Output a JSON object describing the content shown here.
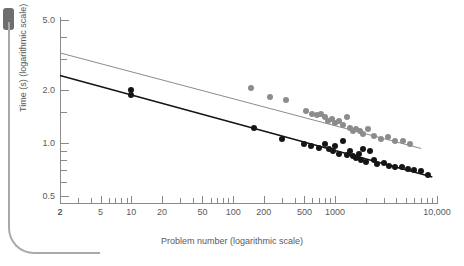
{
  "decor": {
    "tab_name": "bookmark-tab",
    "frame_name": "page-rule"
  },
  "chart_data": {
    "type": "scatter",
    "title": "",
    "xlabel": "Problem number (logarithmic scale)",
    "ylabel": "Time (s) (logarithmic scale)",
    "xscale": "log",
    "yscale": "log",
    "xlim": [
      2,
      10000
    ],
    "ylim": [
      0.45,
      5.2
    ],
    "grid": false,
    "legend": "none",
    "xticks_labeled": [
      {
        "value": 2,
        "label": "2"
      },
      {
        "value": 2,
        "label": "2"
      },
      {
        "value": 5,
        "label": "5"
      },
      {
        "value": 10,
        "label": "10"
      },
      {
        "value": 20,
        "label": "20"
      },
      {
        "value": 50,
        "label": "50"
      },
      {
        "value": 100,
        "label": "100"
      },
      {
        "value": 200,
        "label": "200"
      },
      {
        "value": 500,
        "label": "500"
      },
      {
        "value": 1000,
        "label": "1000"
      },
      {
        "value": 10000,
        "label": "10,000"
      }
    ],
    "yticks_labeled": [
      {
        "value": 5.0,
        "label": "5.0"
      },
      {
        "value": 2.0,
        "label": "2.0"
      },
      {
        "value": 1.0,
        "label": "1.0"
      },
      {
        "value": 0.5,
        "label": "0.5"
      }
    ],
    "yticks_minor": [
      4.0,
      3.0,
      1.5,
      0.9,
      0.8,
      0.7,
      0.6
    ],
    "xticks_minor": [
      3,
      4,
      6,
      7,
      8,
      9,
      30,
      40,
      60,
      70,
      80,
      90,
      300,
      400,
      600,
      700,
      800,
      900,
      2000,
      3000,
      4000,
      5000,
      6000,
      7000,
      8000,
      9000
    ],
    "series": [
      {
        "name": "upper-series",
        "color": "#8c8c8c",
        "marker": "circle",
        "points": [
          [
            150,
            2.05
          ],
          [
            230,
            1.82
          ],
          [
            330,
            1.76
          ],
          [
            520,
            1.52
          ],
          [
            600,
            1.47
          ],
          [
            660,
            1.44
          ],
          [
            720,
            1.47
          ],
          [
            800,
            1.4
          ],
          [
            860,
            1.34
          ],
          [
            930,
            1.37
          ],
          [
            1000,
            1.3
          ],
          [
            1100,
            1.34
          ],
          [
            1200,
            1.26
          ],
          [
            1300,
            1.41
          ],
          [
            1400,
            1.22
          ],
          [
            1500,
            1.17
          ],
          [
            1600,
            1.2
          ],
          [
            1750,
            1.17
          ],
          [
            1900,
            1.13
          ],
          [
            2100,
            1.2
          ],
          [
            2400,
            1.1
          ],
          [
            2800,
            1.06
          ],
          [
            3300,
            1.08
          ],
          [
            3900,
            1.02
          ],
          [
            4600,
            1.03
          ],
          [
            5400,
            0.99
          ]
        ],
        "fit_line": {
          "x1": 2,
          "y1": 3.25,
          "x2": 7000,
          "y2": 0.93
        }
      },
      {
        "name": "lower-series",
        "color": "#151515",
        "marker": "circle",
        "points": [
          [
            10,
            2.0
          ],
          [
            10,
            1.87
          ],
          [
            160,
            1.21
          ],
          [
            300,
            1.06
          ],
          [
            500,
            0.99
          ],
          [
            580,
            0.96
          ],
          [
            700,
            0.94
          ],
          [
            800,
            0.99
          ],
          [
            870,
            0.93
          ],
          [
            950,
            0.9
          ],
          [
            1000,
            0.96
          ],
          [
            1100,
            0.87
          ],
          [
            1200,
            1.02
          ],
          [
            1300,
            0.86
          ],
          [
            1400,
            0.9
          ],
          [
            1500,
            0.84
          ],
          [
            1600,
            0.82
          ],
          [
            1700,
            0.87
          ],
          [
            1800,
            0.8
          ],
          [
            1900,
            0.92
          ],
          [
            2000,
            0.78
          ],
          [
            2200,
            0.9
          ],
          [
            2400,
            0.8
          ],
          [
            2600,
            0.76
          ],
          [
            3000,
            0.77
          ],
          [
            3400,
            0.74
          ],
          [
            3900,
            0.73
          ],
          [
            4500,
            0.73
          ],
          [
            5200,
            0.71
          ],
          [
            6000,
            0.7
          ],
          [
            7000,
            0.69
          ],
          [
            8200,
            0.66
          ]
        ],
        "fit_line": {
          "x1": 2,
          "y1": 2.42,
          "x2": 9000,
          "y2": 0.64
        }
      }
    ]
  }
}
